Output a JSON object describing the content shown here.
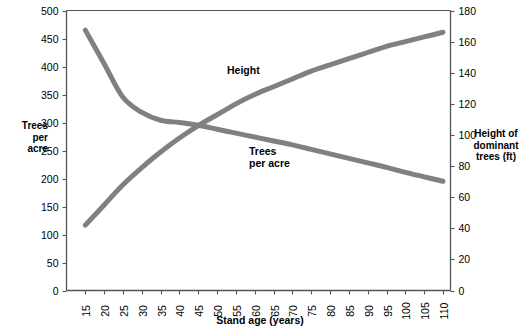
{
  "chart_data": {
    "type": "line",
    "title": "",
    "xlabel": "Stand age (years)",
    "ylabel": "Trees per acre",
    "y2label": "Height of dominant trees (ft)",
    "grid": false,
    "legend_position": "inline-annotations",
    "xlim": [
      10,
      112
    ],
    "ylim": [
      0,
      500
    ],
    "y2lim": [
      0,
      180
    ],
    "xticks": [
      15,
      20,
      25,
      30,
      35,
      40,
      45,
      50,
      55,
      60,
      65,
      70,
      75,
      80,
      85,
      90,
      95,
      100,
      105,
      110
    ],
    "yticks": [
      0,
      50,
      100,
      150,
      200,
      250,
      300,
      350,
      400,
      450,
      500
    ],
    "y2ticks": [
      0,
      20,
      40,
      60,
      80,
      100,
      120,
      140,
      160,
      180
    ],
    "x": [
      15,
      20,
      25,
      30,
      35,
      40,
      45,
      50,
      55,
      60,
      65,
      70,
      75,
      80,
      85,
      90,
      95,
      100,
      105,
      110
    ],
    "series": [
      {
        "name": "Trees per acre",
        "axis": "left",
        "color": "#808080",
        "values": [
          465,
          405,
          345,
          318,
          304,
          300,
          295,
          288,
          281,
          274,
          267,
          260,
          252,
          244,
          236,
          228,
          220,
          211,
          203,
          195
        ]
      },
      {
        "name": "Height",
        "axis": "right",
        "color": "#808080",
        "values": [
          42,
          55,
          68,
          79,
          89,
          98,
          106,
          113,
          120,
          126,
          131,
          136,
          141,
          145,
          149,
          153,
          157,
          160,
          163,
          166
        ]
      }
    ],
    "annotations": [
      {
        "text": "Height",
        "x": 53,
        "y2": 140
      },
      {
        "text": "Trees\nper acre",
        "x": 62,
        "y": 250
      }
    ]
  },
  "labels": {
    "ytitle_left": "Trees\nper\nacre",
    "ytitle_left_lines": [
      "Trees",
      "per",
      "acre"
    ],
    "ytitle_right_lines": [
      "Height of",
      "dominant",
      "trees (ft)"
    ],
    "xtitle": "Stand age (years)",
    "series_height": "Height",
    "series_trees_lines": [
      "Trees",
      "per acre"
    ]
  },
  "colors": {
    "line": "#808080",
    "axis": "#555555",
    "text": "#000000",
    "background": "#ffffff"
  }
}
